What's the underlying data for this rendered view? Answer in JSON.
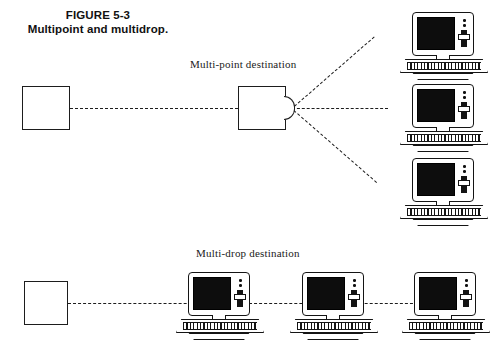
{
  "figure": {
    "caption_line1": "FIGURE 5-3",
    "caption_line2": "Multipoint and multidrop.",
    "ink_color": "#141414",
    "background_color": "#ffffff"
  },
  "sections": {
    "multipoint": {
      "label": "Multi-point destination",
      "source_box_label": "",
      "junction_box_label": "",
      "destination_count": 3,
      "link_style": "dashed"
    },
    "multidrop": {
      "label": "Multi-drop destination",
      "source_box_label": "",
      "destination_count": 3,
      "link_style": "dashed"
    }
  },
  "icons": {
    "computer": "computer-workstation-icon",
    "source": "source-node-box",
    "junction": "junction-node-box",
    "fanout": "fanout-node-icon"
  }
}
